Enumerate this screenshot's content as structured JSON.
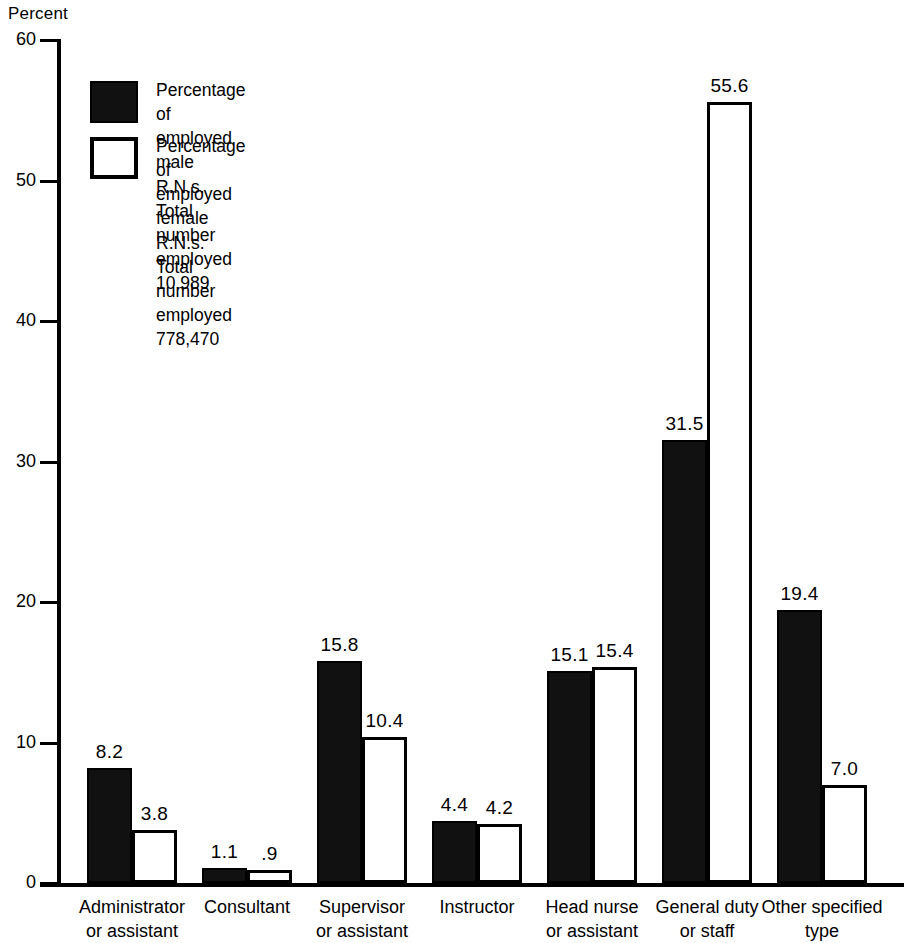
{
  "axis": {
    "y_title": "Percent",
    "y_ticks": [
      "60",
      "50",
      "40",
      "30",
      "20",
      "10",
      "0"
    ]
  },
  "legend": {
    "male_label": "Percentage of employed male R.N.s. Total number\nemployed 10.989",
    "female_label": "Percentage of employed female R.N.s. Total number\nemployed 778,470",
    "male_swatch": "black-filled-square",
    "female_swatch": "white-outlined-square"
  },
  "categories": [
    "Administrator\nor assistant",
    "Consultant",
    "Supervisor\nor assistant",
    "Instructor",
    "Head nurse\nor assistant",
    "General duty\nor staff",
    "Other specified\ntype"
  ],
  "labels": {
    "male": [
      "8.2",
      "1.1",
      "15.8",
      "4.4",
      "15.1",
      "31.5",
      "19.4"
    ],
    "female": [
      "3.8",
      ".9",
      "10.4",
      "4.2",
      "15.4",
      "55.6",
      "7.0"
    ]
  },
  "chart_data": {
    "type": "bar",
    "title": "",
    "xlabel": "",
    "ylabel": "Percent",
    "ylim": [
      0,
      60
    ],
    "yticks": [
      0,
      10,
      20,
      30,
      40,
      50,
      60
    ],
    "grid": false,
    "legend_position": "inside-top-left",
    "categories": [
      "Administrator or assistant",
      "Consultant",
      "Supervisor or assistant",
      "Instructor",
      "Head nurse or assistant",
      "General duty or staff",
      "Other specified type"
    ],
    "series": [
      {
        "name": "Percentage of employed male R.N.s. Total number employed 10.989",
        "color": "#111111",
        "values": [
          8.2,
          1.1,
          15.8,
          4.4,
          15.1,
          31.5,
          19.4
        ]
      },
      {
        "name": "Percentage of employed female R.N.s. Total number employed 778,470",
        "color": "#ffffff",
        "values": [
          3.8,
          0.9,
          10.4,
          4.2,
          15.4,
          55.6,
          7.0
        ]
      }
    ]
  }
}
